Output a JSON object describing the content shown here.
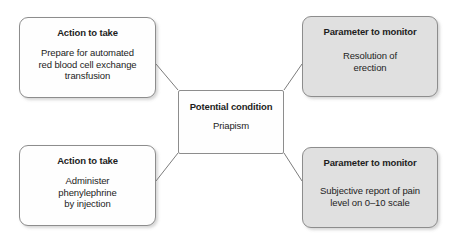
{
  "diagram": {
    "width": 456,
    "height": 241,
    "background_color": "#ffffff",
    "border_color": "#8d8d8d",
    "gray_fill_color": "#e0e0e0",
    "white_fill_color": "#fefefe",
    "connector_color": "#7d7d7d",
    "nodes": {
      "action_top": {
        "title": "Action to take",
        "lines": [
          "Prepare for automated",
          "red blood cell exchange",
          "transfusion"
        ]
      },
      "action_bottom": {
        "title": "Action to take",
        "lines": [
          "Administer",
          "phenylephrine",
          "by injection"
        ]
      },
      "condition": {
        "title": "Potential condition",
        "lines": [
          "Priapism"
        ]
      },
      "param_top": {
        "title": "Parameter to monitor",
        "lines": [
          "Resolution of",
          "erection"
        ]
      },
      "param_bottom": {
        "title": "Parameter to monitor",
        "lines": [
          "Subjective report of pain",
          "level on 0–10 scale"
        ]
      }
    },
    "connectors": [
      {
        "name": "condition-to-action-top",
        "from": [
          178,
          90
        ],
        "to": [
          156,
          64
        ]
      },
      {
        "name": "condition-to-param-top",
        "from": [
          284,
          90
        ],
        "to": [
          302,
          64
        ]
      },
      {
        "name": "condition-to-action-bottom",
        "from": [
          178,
          153
        ],
        "to": [
          156,
          181
        ]
      },
      {
        "name": "condition-to-param-bottom",
        "from": [
          284,
          153
        ],
        "to": [
          302,
          181
        ]
      }
    ]
  }
}
